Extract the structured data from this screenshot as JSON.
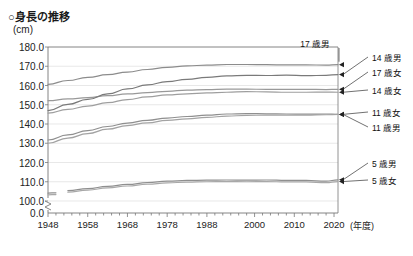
{
  "title": "○身長の推移",
  "unit_label": "(cm)",
  "x_unit_label": "(年度)",
  "axis": {
    "y_ticks": [
      "180.0",
      "170.0",
      "160.0",
      "150.0",
      "140.0",
      "130.0",
      "120.0",
      "110.0",
      "100.0",
      "0.0"
    ],
    "x_ticks": [
      "1948",
      "1958",
      "1968",
      "1978",
      "1988",
      "2000",
      "2010",
      "2020"
    ]
  },
  "chart_data": {
    "type": "line",
    "title": "○身長の推移",
    "xlabel": "(年度)",
    "ylabel": "(cm)",
    "ylim": [
      100.0,
      180.0
    ],
    "xlim": [
      1948,
      2021
    ],
    "y_break": "axis broken between 0.0 and 100.0",
    "grid": true,
    "legend_position": "right-inline-labels",
    "series": [
      {
        "name": "17歳男",
        "color": "#8c8c8c",
        "x": [
          1948,
          1953,
          1958,
          1963,
          1968,
          1973,
          1978,
          1983,
          1988,
          1993,
          1998,
          2003,
          2008,
          2013,
          2018,
          2021
        ],
        "values": [
          160.6,
          162.6,
          164.2,
          165.6,
          167.0,
          168.3,
          169.4,
          170.2,
          170.6,
          170.9,
          170.9,
          170.8,
          170.7,
          170.7,
          170.6,
          170.8
        ]
      },
      {
        "name": "17歳女",
        "color": "#999999",
        "x": [
          1948,
          1953,
          1958,
          1963,
          1968,
          1973,
          1978,
          1983,
          1988,
          1993,
          1998,
          2003,
          2008,
          2013,
          2018,
          2021
        ],
        "values": [
          152.1,
          153.0,
          153.7,
          154.7,
          155.6,
          156.3,
          157.0,
          157.6,
          157.9,
          158.1,
          158.1,
          158.0,
          158.0,
          158.0,
          157.9,
          158.0
        ]
      },
      {
        "name": "14歳男",
        "color": "#7a7a7a",
        "x": [
          1948,
          1953,
          1958,
          1963,
          1968,
          1973,
          1978,
          1983,
          1988,
          1993,
          1998,
          2003,
          2008,
          2013,
          2018,
          2021
        ],
        "values": [
          147.0,
          150.2,
          152.8,
          155.6,
          158.2,
          160.3,
          162.0,
          163.2,
          164.2,
          165.0,
          165.3,
          165.2,
          165.4,
          165.1,
          165.3,
          165.7
        ]
      },
      {
        "name": "14歳女",
        "color": "#9e9e9e",
        "x": [
          1948,
          1953,
          1958,
          1963,
          1968,
          1973,
          1978,
          1983,
          1988,
          1993,
          1998,
          2003,
          2008,
          2013,
          2018,
          2021
        ],
        "values": [
          145.7,
          147.6,
          149.3,
          151.1,
          152.7,
          154.1,
          155.1,
          155.7,
          156.2,
          156.5,
          156.8,
          156.7,
          156.5,
          156.5,
          156.6,
          156.5
        ]
      },
      {
        "name": "11歳女",
        "color": "#8f8f8f",
        "x": [
          1948,
          1953,
          1958,
          1963,
          1968,
          1973,
          1978,
          1983,
          1988,
          1993,
          1998,
          2003,
          2008,
          2013,
          2018,
          2021
        ],
        "values": [
          131.7,
          134.3,
          136.6,
          138.7,
          140.5,
          141.9,
          143.1,
          143.9,
          144.6,
          145.2,
          145.4,
          145.3,
          145.2,
          145.1,
          145.2,
          145.0
        ]
      },
      {
        "name": "11歳男",
        "color": "#a3a3a3",
        "x": [
          1948,
          1953,
          1958,
          1963,
          1968,
          1973,
          1978,
          1983,
          1988,
          1993,
          1998,
          2003,
          2008,
          2013,
          2018,
          2021
        ],
        "values": [
          130.0,
          132.7,
          135.0,
          137.3,
          139.2,
          140.6,
          141.9,
          142.7,
          143.4,
          144.1,
          144.5,
          144.6,
          144.6,
          144.6,
          144.8,
          145.0
        ]
      },
      {
        "name": "5歳男",
        "color": "#8f8f8f",
        "x": [
          1948,
          1953,
          1958,
          1963,
          1968,
          1973,
          1978,
          1983,
          1988,
          1993,
          1998,
          2003,
          2008,
          2013,
          2018,
          2021
        ],
        "values": [
          104.1,
          105.4,
          106.4,
          107.6,
          108.6,
          109.5,
          110.3,
          110.7,
          110.8,
          110.9,
          110.8,
          110.9,
          110.7,
          110.7,
          110.3,
          111.0
        ]
      },
      {
        "name": "5歳女",
        "color": "#a8a8a8",
        "x": [
          1948,
          1953,
          1958,
          1963,
          1968,
          1973,
          1978,
          1983,
          1988,
          1993,
          1998,
          2003,
          2008,
          2013,
          2018,
          2021
        ],
        "values": [
          103.2,
          104.6,
          105.7,
          106.8,
          107.8,
          108.7,
          109.4,
          109.8,
          110.0,
          110.1,
          110.0,
          110.1,
          109.9,
          109.9,
          109.5,
          110.1
        ]
      }
    ],
    "annotations": [
      {
        "label": "17歳男",
        "kind": "callout-top"
      },
      {
        "label": "14歳男",
        "kind": "callout-right"
      },
      {
        "label": "17歳女",
        "kind": "callout-right"
      },
      {
        "label": "14歳女",
        "kind": "callout-right"
      },
      {
        "label": "11歳女",
        "kind": "callout-right"
      },
      {
        "label": "11歳男",
        "kind": "callout-right"
      },
      {
        "label": "5歳男",
        "kind": "callout-right"
      },
      {
        "label": "5歳女",
        "kind": "callout-right"
      }
    ]
  },
  "labels": {
    "s17m": "17 歳男",
    "s14m": "14 歳男",
    "s17f": "17 歳女",
    "s14f": "14 歳女",
    "s11f": "11 歳女",
    "s11m": "11 歳男",
    "s5m": "5 歳男",
    "s5f": "5 歳女"
  }
}
